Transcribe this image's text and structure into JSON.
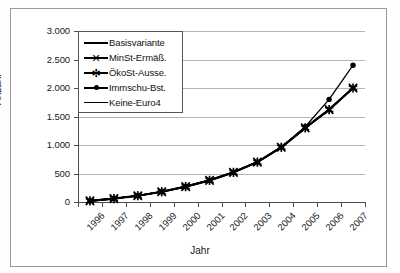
{
  "chart_data": {
    "type": "line",
    "title": "",
    "xlabel": "Jahr",
    "ylabel": "Anzahl",
    "categories": [
      "1996",
      "1997",
      "1998",
      "1999",
      "2000",
      "2001",
      "2002",
      "2003",
      "2004",
      "2005",
      "2006",
      "2007"
    ],
    "ytick_labels": [
      "0",
      "500",
      "1.000",
      "1.500",
      "2.000",
      "2.500",
      "3.000"
    ],
    "ytick_values": [
      0,
      500,
      1000,
      1500,
      2000,
      2500,
      3000
    ],
    "ylim": [
      0,
      3000
    ],
    "grid": true,
    "legend_position": "top-left-inside",
    "series": [
      {
        "name": "Basisvariante",
        "marker": "none",
        "values": [
          20,
          60,
          110,
          180,
          270,
          380,
          520,
          700,
          960,
          1300,
          1620,
          2000
        ]
      },
      {
        "name": "MinSt-Ermäß.",
        "marker": "x",
        "values": [
          20,
          60,
          110,
          180,
          270,
          380,
          520,
          700,
          960,
          1300,
          1620,
          2000
        ]
      },
      {
        "name": "ÖkoSt-Ausse.",
        "marker": "star",
        "values": [
          20,
          60,
          110,
          180,
          270,
          380,
          520,
          700,
          960,
          1300,
          1620,
          2000
        ]
      },
      {
        "name": "Immschu-Bst.",
        "marker": "dot",
        "values": [
          20,
          60,
          110,
          180,
          270,
          380,
          520,
          700,
          960,
          1320,
          1800,
          2400
        ]
      },
      {
        "name": "Keine-Euro4",
        "marker": "none",
        "values": [
          20,
          60,
          110,
          180,
          270,
          380,
          520,
          700,
          960,
          1300,
          1620,
          2000
        ]
      }
    ]
  },
  "legend": {
    "items": [
      {
        "label": "Basisvariante",
        "key": "line-thick"
      },
      {
        "label": "MinSt-Ermäß.",
        "key": "line-x-marker"
      },
      {
        "label": "ÖkoSt-Ausse.",
        "key": "line-star-marker"
      },
      {
        "label": "Immschu-Bst.",
        "key": "line-dot-marker"
      },
      {
        "label": "Keine-Euro4",
        "key": "line-thin"
      }
    ]
  },
  "glyphs": {
    "x_marker": "✕",
    "star_marker": "✻"
  },
  "colors": {
    "series": "#000000",
    "grid": "#b4b4b4",
    "axis": "#4d4d4d",
    "frame": "#9a9a9a",
    "background": "#ffffff"
  }
}
